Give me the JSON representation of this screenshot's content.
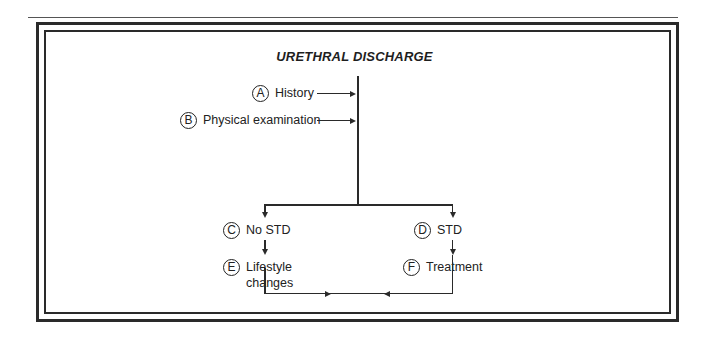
{
  "diagram": {
    "title": "URETHRAL DISCHARGE",
    "inputs": [
      {
        "letter": "A",
        "label": "History"
      },
      {
        "letter": "B",
        "label": "Physical examination"
      }
    ],
    "branches": [
      {
        "letter": "C",
        "label": "No STD",
        "next": {
          "letter": "E",
          "label_line1": "Lifestyle",
          "label_line2": "changes"
        }
      },
      {
        "letter": "D",
        "label": "STD",
        "next": {
          "letter": "F",
          "label_line1": "Treatment"
        }
      }
    ]
  }
}
